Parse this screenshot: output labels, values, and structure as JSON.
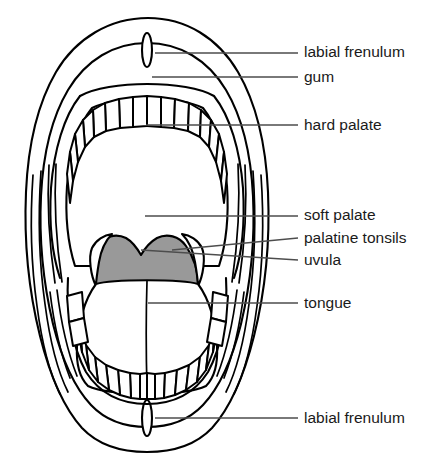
{
  "figure": {
    "background_color": "#ffffff",
    "outline_color": "#000000",
    "leader_line_color": "#4d4d4d",
    "soft_palate_fill": "#999999",
    "tongue_fill": "#ffffff",
    "tooth_fill": "#ffffff"
  },
  "labels": [
    {
      "id": "labial-frenulum-upper",
      "text": "labial frenulum",
      "text_x": 304,
      "text_y": 57,
      "leader": {
        "x1": 155,
        "y1": 53,
        "x2": 298,
        "y2": 53
      }
    },
    {
      "id": "gum",
      "text": "gum",
      "text_x": 304,
      "text_y": 82,
      "leader": {
        "x1": 152,
        "y1": 77,
        "x2": 298,
        "y2": 77
      }
    },
    {
      "id": "hard-palate",
      "text": "hard palate",
      "text_x": 304,
      "text_y": 130,
      "leader": {
        "x1": 146,
        "y1": 125,
        "x2": 298,
        "y2": 125
      }
    },
    {
      "id": "soft-palate",
      "text": "soft palate",
      "text_x": 304,
      "text_y": 220,
      "leader": {
        "x1": 145,
        "y1": 216,
        "x2": 298,
        "y2": 216
      }
    },
    {
      "id": "palatine-tonsils",
      "text": "palatine tonsils",
      "text_x": 304,
      "text_y": 243,
      "leader": {
        "x1": 172,
        "y1": 250,
        "x2": 298,
        "y2": 238
      }
    },
    {
      "id": "uvula",
      "text": "uvula",
      "text_x": 304,
      "text_y": 265,
      "leader": {
        "x1": 141,
        "y1": 250,
        "x2": 298,
        "y2": 260
      }
    },
    {
      "id": "tongue",
      "text": "tongue",
      "text_x": 304,
      "text_y": 308,
      "leader": {
        "x1": 148,
        "y1": 303,
        "x2": 298,
        "y2": 303
      }
    },
    {
      "id": "labial-frenulum-lower",
      "text": "labial frenulum",
      "text_x": 304,
      "text_y": 423,
      "leader": {
        "x1": 155,
        "y1": 418,
        "x2": 298,
        "y2": 418
      }
    }
  ],
  "structures": [
    {
      "id": "face-outline",
      "name": "outer lip and face outline"
    },
    {
      "id": "inner-lip-outline",
      "name": "inner lip / vestibule outline"
    },
    {
      "id": "cheek-lines-left",
      "name": "left cheek fold lines"
    },
    {
      "id": "cheek-lines-right",
      "name": "right cheek fold lines"
    },
    {
      "id": "upper-gum-arch",
      "name": "upper gum (gingiva) arch"
    },
    {
      "id": "upper-teeth",
      "name": "upper dental arch",
      "tooth_count": 16
    },
    {
      "id": "hard-palate-region",
      "name": "hard palate"
    },
    {
      "id": "soft-palate-region",
      "name": "soft palate with uvula notch"
    },
    {
      "id": "palatine-tonsil-left",
      "name": "left palatine tonsil"
    },
    {
      "id": "palatine-tonsil-right",
      "name": "right palatine tonsil"
    },
    {
      "id": "tongue-body",
      "name": "tongue"
    },
    {
      "id": "tongue-midline",
      "name": "median sulcus of tongue"
    },
    {
      "id": "lower-teeth",
      "name": "lower dental arch",
      "tooth_count": 16
    },
    {
      "id": "labial-frenulum-upper-shape",
      "name": "upper labial frenulum"
    },
    {
      "id": "labial-frenulum-lower-shape",
      "name": "lower labial frenulum"
    }
  ]
}
